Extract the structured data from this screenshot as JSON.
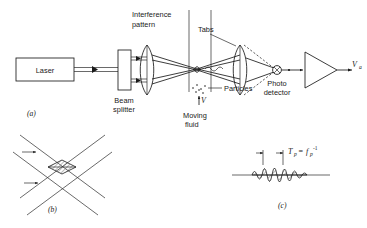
{
  "figure": {
    "panels": [
      {
        "id": "a",
        "label": "(a)"
      },
      {
        "id": "b",
        "label": "(b)"
      },
      {
        "id": "c",
        "label": "(c)"
      }
    ]
  },
  "panel_a": {
    "laser_label": "Laser",
    "beam_splitter_label_line1": "Beam",
    "beam_splitter_label_line2": "splitter",
    "interference_label_line1": "Interference",
    "interference_label_line2": "pattern",
    "lens_label": "Tabs",
    "particles_label": "Particles",
    "moving_fluid_label_line1": "Moving",
    "moving_fluid_label_line2": "fluid",
    "photo_detector_label_line1": "Photo",
    "photo_detector_label_line2": "detector",
    "velocity_symbol": "V",
    "output_symbol": "V",
    "output_subscript": "a"
  },
  "panel_b": {
    "caption": "(b)"
  },
  "panel_c": {
    "period_symbol": "T",
    "period_subscript": "p",
    "equals": "=",
    "freq_symbol": "f",
    "freq_subscript": "p",
    "freq_exponent": "-1",
    "caption": "(c)"
  },
  "colors": {
    "ink": "#1a1a1a",
    "paper": "#ffffff",
    "hatch": "#555555"
  }
}
